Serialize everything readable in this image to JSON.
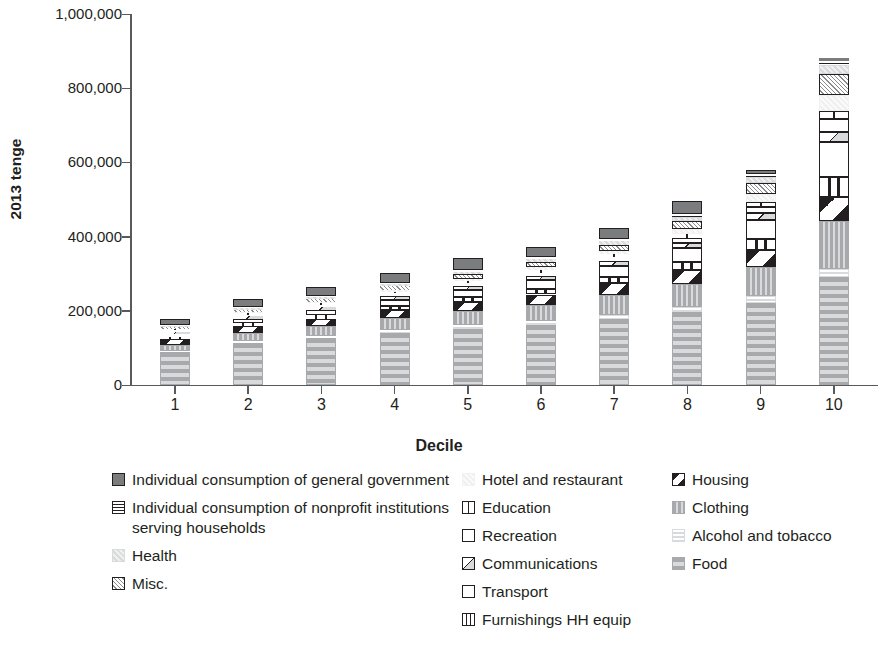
{
  "chart_data": {
    "type": "bar",
    "subtype": "stacked-bar",
    "title": "",
    "xlabel": "Decile",
    "ylabel": "2013 tenge",
    "categories": [
      "1",
      "2",
      "3",
      "4",
      "5",
      "6",
      "7",
      "8",
      "9",
      "10"
    ],
    "ylim": [
      0,
      1000000
    ],
    "ytick_labels": [
      "0",
      "200,000",
      "400,000",
      "600,000",
      "800,000",
      "1,000,000"
    ],
    "ytick_values": [
      0,
      200000,
      400000,
      600000,
      800000,
      1000000
    ],
    "grid": false,
    "legend_position": "bottom",
    "stack_order_bottom_to_top": [
      "Food",
      "Alcohol and tobacco",
      "Clothing",
      "Housing",
      "Furnishings HH equip",
      "Transport",
      "Communications",
      "Recreation",
      "Education",
      "Hotel and restaurant",
      "Misc.",
      "Health",
      "Individual consumption of nonprofit institutions serving households",
      "Individual consumption of general government"
    ],
    "totals": [
      178000,
      232000,
      265000,
      302000,
      337000,
      372000,
      422000,
      487000,
      580000,
      881000
    ],
    "series": [
      {
        "name": "Food",
        "values": [
          88000,
          112000,
          126000,
          140000,
          152000,
          162000,
          178000,
          196000,
          222000,
          290000
        ]
      },
      {
        "name": "Alcohol and tobacco",
        "values": [
          5000,
          6000,
          7000,
          8000,
          9000,
          10000,
          12000,
          14000,
          17000,
          24000
        ]
      },
      {
        "name": "Clothing",
        "values": [
          16000,
          22000,
          26000,
          32000,
          38000,
          44000,
          52000,
          62000,
          80000,
          128000
        ]
      },
      {
        "name": "Housing",
        "values": [
          14000,
          18000,
          20000,
          23000,
          25000,
          28000,
          32000,
          37000,
          45000,
          66000
        ]
      },
      {
        "name": "Furnishings HH equip",
        "values": [
          6000,
          8000,
          9000,
          11000,
          13000,
          15000,
          18000,
          23000,
          30000,
          52000
        ]
      },
      {
        "name": "Transport",
        "values": [
          8000,
          11000,
          13000,
          16000,
          19000,
          23000,
          28000,
          36000,
          50000,
          96000
        ]
      },
      {
        "name": "Communications",
        "values": [
          7000,
          9000,
          10000,
          11000,
          12000,
          13000,
          14000,
          16000,
          19000,
          27000
        ]
      },
      {
        "name": "Recreation",
        "values": [
          3000,
          4000,
          5000,
          6000,
          7000,
          8000,
          10000,
          13000,
          18000,
          34000
        ]
      },
      {
        "name": "Education",
        "values": [
          3000,
          4000,
          4000,
          5000,
          6000,
          7000,
          8000,
          10000,
          13000,
          22000
        ]
      },
      {
        "name": "Hotel and restaurant",
        "values": [
          2000,
          3000,
          4000,
          5000,
          6000,
          8000,
          10000,
          14000,
          21000,
          44000
        ]
      },
      {
        "name": "Misc.",
        "values": [
          5000,
          6000,
          7000,
          9000,
          11000,
          13000,
          16000,
          21000,
          29000,
          54000
        ]
      },
      {
        "name": "Health",
        "values": [
          3000,
          4000,
          5000,
          6000,
          7000,
          8000,
          10000,
          12000,
          16000,
          26000
        ]
      },
      {
        "name": "Individual consumption of nonprofit institutions serving households",
        "values": [
          3000,
          3000,
          4000,
          4000,
          5000,
          5000,
          6000,
          7000,
          8000,
          10000
        ]
      },
      {
        "name": "Individual consumption of general government",
        "values": [
          15000,
          22000,
          25000,
          26000,
          32000,
          28000,
          28000,
          36000,
          12000,
          8000
        ]
      }
    ]
  },
  "axis": {
    "y_title": "2013 tenge",
    "x_title": "Decile",
    "y_ticks": [
      "1,000,000",
      "800,000",
      "600,000",
      "400,000",
      "200,000",
      "0"
    ],
    "x_ticks": [
      "1",
      "2",
      "3",
      "4",
      "5",
      "6",
      "7",
      "8",
      "9",
      "10"
    ]
  },
  "legend": {
    "columns": [
      {
        "items": [
          {
            "label": "Individual consumption of general government",
            "pattern": "solid-darkgray"
          },
          {
            "label": "Individual consumption of nonprofit institutions serving households",
            "pattern": "hlines-box"
          },
          {
            "label": "Health",
            "pattern": "light-dotted"
          },
          {
            "label": "Misc.",
            "pattern": "crosshatch-box"
          }
        ]
      },
      {
        "items": [
          {
            "label": "Hotel and restaurant",
            "pattern": "very-light-dotted"
          },
          {
            "label": "Education",
            "pattern": "vline-box"
          },
          {
            "label": "Recreation",
            "pattern": "empty-box"
          },
          {
            "label": "Communications",
            "pattern": "diag-half-box"
          },
          {
            "label": "Transport",
            "pattern": "empty-box"
          },
          {
            "label": "Furnishings HH equip",
            "pattern": "double-vline-box"
          }
        ]
      },
      {
        "items": [
          {
            "label": "Housing",
            "pattern": "diag-stripe-box"
          },
          {
            "label": "Clothing",
            "pattern": "medium-vstripe"
          },
          {
            "label": "Alcohol and tobacco",
            "pattern": "pale-hstripe"
          },
          {
            "label": "Food",
            "pattern": "gray-hstripe"
          }
        ]
      }
    ]
  },
  "colors": {
    "axis": "#58595b",
    "text": "#231f20",
    "dark_gray": "#7b7c7e",
    "mid_gray": "#a7a9ac",
    "light_gray": "#d9dadb",
    "pale_gray": "#efefef"
  }
}
